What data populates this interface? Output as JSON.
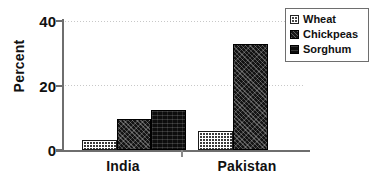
{
  "chart_data": {
    "type": "bar",
    "title": "",
    "xlabel": "",
    "ylabel": "Percent",
    "categories": [
      "India",
      "Pakistan"
    ],
    "series": [
      {
        "name": "Wheat",
        "values": [
          3,
          6
        ]
      },
      {
        "name": "Chickpeas",
        "values": [
          9.7,
          33
        ]
      },
      {
        "name": "Sorghum",
        "values": [
          12.4,
          null
        ]
      }
    ],
    "ylim": [
      0,
      40
    ],
    "yticks": [
      0,
      20,
      40
    ],
    "ytick_labels": [
      "0",
      "20",
      "40"
    ],
    "grid": "horizontal-dotted",
    "legend_position": "top-right"
  },
  "axis": {
    "y_label": "Percent",
    "tick_0": "0",
    "tick_20": "20",
    "tick_40": "40"
  },
  "categories": {
    "india": "India",
    "pakistan": "Pakistan"
  },
  "legend": {
    "items": [
      {
        "label": "Wheat",
        "swatch": "wheat-swatch-icon"
      },
      {
        "label": "Chickpeas",
        "swatch": "chickpeas-swatch-icon"
      },
      {
        "label": "Sorghum",
        "swatch": "sorghum-swatch-icon"
      }
    ]
  },
  "colors": {
    "wheat": "#3a3a3a",
    "chickpeas": "#141414",
    "sorghum": "#0d0d0d",
    "axis": "#6e6e6e",
    "grid": "#c8c8c8",
    "text": "#111111",
    "background": "#ffffff"
  }
}
